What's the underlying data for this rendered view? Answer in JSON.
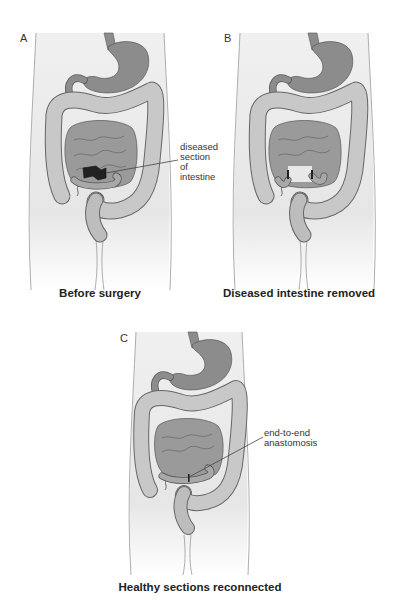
{
  "figure": {
    "panels": [
      {
        "letter": "A",
        "caption": "Before surgery",
        "callout": [
          "diseased",
          "section of",
          "intestine"
        ]
      },
      {
        "letter": "B",
        "caption": "Diseased intestine removed"
      },
      {
        "letter": "C",
        "caption": "Healthy sections reconnected",
        "callout": [
          "end-to-end",
          "anastomosis"
        ]
      }
    ],
    "colors": {
      "body_fill": "#f1f1f1",
      "body_outline": "#9a9a9a",
      "stomach": "#8c8c8c",
      "small_intestine": "#9a9a9a",
      "colon": "#c4c4c4",
      "diseased_section": "#222222",
      "organ_outline": "#555555"
    }
  }
}
